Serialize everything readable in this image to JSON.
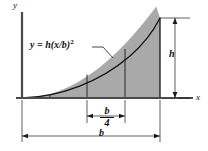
{
  "figure": {
    "curve_equation": "y = h(x/b)",
    "curve_exponent": "2",
    "axis_labels": {
      "y": "y",
      "x": "x"
    },
    "dimensions": {
      "height_label": "h",
      "base_label": "b",
      "segment_numerator": "b",
      "segment_denominator": "4"
    },
    "colors": {
      "fill": "#a9a9a9",
      "line": "#1a1a1a",
      "background": "#ffffff"
    },
    "geometry": {
      "origin_x": 22,
      "origin_y": 98,
      "curve_peak_x": 160,
      "curve_peak_y": 18,
      "divider_x": [
        50,
        87,
        125
      ],
      "base_span": [
        22,
        160
      ],
      "segment_span": [
        87,
        125
      ],
      "height_span": [
        18,
        98
      ]
    }
  }
}
